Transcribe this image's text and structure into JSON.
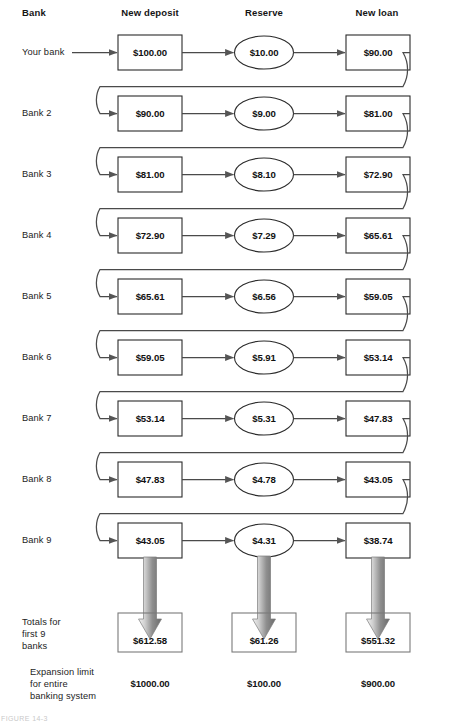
{
  "figure": {
    "title_caption": "FIGURE 14-3",
    "columns": [
      {
        "key": "bank",
        "label": "Bank",
        "x": 22,
        "align": "left"
      },
      {
        "key": "new_deposit",
        "label": "New deposit",
        "x": 150,
        "align": "center"
      },
      {
        "key": "reserve",
        "label": "Reserve",
        "x": 264,
        "align": "center"
      },
      {
        "key": "new_loan",
        "label": "New loan",
        "x": 377,
        "align": "center"
      }
    ],
    "rows": [
      {
        "label": "Your bank",
        "new_deposit": "$100.00",
        "reserve": "$10.00",
        "new_loan": "$90.00"
      },
      {
        "label": "Bank 2",
        "new_deposit": "$90.00",
        "reserve": "$9.00",
        "new_loan": "$81.00"
      },
      {
        "label": "Bank 3",
        "new_deposit": "$81.00",
        "reserve": "$8.10",
        "new_loan": "$72.90"
      },
      {
        "label": "Bank 4",
        "new_deposit": "$72.90",
        "reserve": "$7.29",
        "new_loan": "$65.61"
      },
      {
        "label": "Bank 5",
        "new_deposit": "$65.61",
        "reserve": "$6.56",
        "new_loan": "$59.05"
      },
      {
        "label": "Bank 6",
        "new_deposit": "$59.05",
        "reserve": "$5.91",
        "new_loan": "$53.14"
      },
      {
        "label": "Bank 7",
        "new_deposit": "$53.14",
        "reserve": "$5.31",
        "new_loan": "$47.83"
      },
      {
        "label": "Bank 8",
        "new_deposit": "$47.83",
        "reserve": "$4.78",
        "new_loan": "$43.05"
      },
      {
        "label": "Bank 9",
        "new_deposit": "$43.05",
        "reserve": "$4.31",
        "new_loan": "$38.74"
      }
    ],
    "totals": {
      "label": "Totals for\nfirst 9\nbanks",
      "new_deposit": "$612.58",
      "reserve": "$61.26",
      "new_loan": "$551.32"
    },
    "expansion_limit": {
      "label": "Expansion limit\nfor entire\nbanking system",
      "new_deposit": "$1000.00",
      "reserve": "$100.00",
      "new_loan": "$900.00"
    },
    "colors": {
      "stroke": "#4a4a4a",
      "box_stroke": "#2b2b2b",
      "text": "#1b1b1b",
      "arrow_grad_light": "#eeeeee",
      "arrow_grad_dark": "#6e6e6e",
      "background": "#ffffff"
    }
  },
  "chart_data": {
    "type": "table",
    "columns": [
      "Bank",
      "New deposit",
      "Reserve",
      "New loan"
    ],
    "reserve_ratio": 0.1,
    "rows": [
      [
        "Your bank",
        100.0,
        10.0,
        90.0
      ],
      [
        "Bank 2",
        90.0,
        9.0,
        81.0
      ],
      [
        "Bank 3",
        81.0,
        8.1,
        72.9
      ],
      [
        "Bank 4",
        72.9,
        7.29,
        65.61
      ],
      [
        "Bank 5",
        65.61,
        6.56,
        59.05
      ],
      [
        "Bank 6",
        59.05,
        5.91,
        53.14
      ],
      [
        "Bank 7",
        53.14,
        5.31,
        47.83
      ],
      [
        "Bank 8",
        47.83,
        4.78,
        43.05
      ],
      [
        "Bank 9",
        43.05,
        4.31,
        38.74
      ]
    ],
    "totals_first_9_banks": [
      612.58,
      61.26,
      551.32
    ],
    "expansion_limit_entire_system": [
      1000.0,
      100.0,
      900.0
    ]
  }
}
